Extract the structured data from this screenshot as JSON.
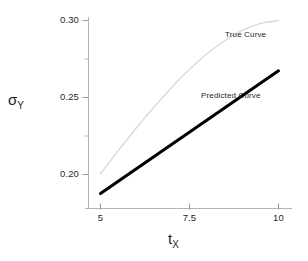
{
  "chart_data": {
    "type": "line",
    "title": "",
    "xlabel": "t_X",
    "ylabel": "sigma_Y",
    "xlim": [
      4.6,
      10.5
    ],
    "ylim": [
      0.182,
      0.3045
    ],
    "grid": false,
    "legend_position": "inline-annotations",
    "x_ticks": [
      5,
      7.5,
      10
    ],
    "x_tick_labels": [
      "5",
      "7.5",
      "10"
    ],
    "y_ticks": [
      0.2,
      0.25,
      0.3
    ],
    "y_tick_labels": [
      "0.20",
      "0.25",
      "0.30"
    ],
    "y_minor_ticks": [
      0.225,
      0.275
    ],
    "series": [
      {
        "name": "True Curve",
        "color": "#d9d9d9",
        "line_width": 1,
        "style": "smooth-concave",
        "x": [
          5.0,
          5.5,
          6.0,
          6.5,
          7.0,
          7.5,
          8.0,
          8.5,
          9.0,
          9.5,
          10.0
        ],
        "values": [
          0.2005,
          0.2155,
          0.23,
          0.2437,
          0.2565,
          0.2683,
          0.2786,
          0.287,
          0.2937,
          0.2981,
          0.3
        ]
      },
      {
        "name": "Predicted Curve",
        "color": "#000000",
        "line_width": 3,
        "style": "straight",
        "x": [
          5.0,
          10.0
        ],
        "values": [
          0.1876,
          0.2673
        ]
      }
    ],
    "annotations": [
      {
        "text": "True Curve",
        "x": 9.35,
        "y": 0.2935
      },
      {
        "text": "Predicted Curve",
        "x": 8.3,
        "y": 0.2345
      }
    ]
  },
  "axes": {
    "y_title": "σ",
    "y_subscript": "Y",
    "x_title": "t",
    "x_subscript": "X"
  },
  "labels": {
    "y0": "0.30",
    "y1": "0.25",
    "y2": "0.20",
    "x0": "5",
    "x1": "7.5",
    "x2": "10",
    "true_curve": "True Curve",
    "predicted_curve": "Predicted Curve"
  },
  "colors": {
    "true_curve": "#d9d9d9",
    "predicted_curve": "#000000",
    "axis": "#b0b0b0",
    "text": "#1f1f1f",
    "background": "#ffffff"
  }
}
